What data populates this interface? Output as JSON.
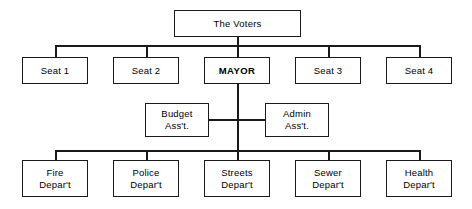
{
  "diagram": {
    "type": "organizational-chart",
    "background_color": "#ffffff",
    "line_color": "#1a1a1a",
    "text_color": "#000000",
    "levels": [
      {
        "level": 1,
        "name": "electorate",
        "nodes": [
          {
            "id": "voters",
            "label": "The Voters",
            "emphasis": false,
            "x": 174,
            "y": 10,
            "w": 127,
            "h": 27
          }
        ]
      },
      {
        "level": 2,
        "name": "elected-officials",
        "nodes": [
          {
            "id": "seat1",
            "label": "Seat 1",
            "emphasis": false,
            "x": 22,
            "y": 57,
            "w": 66,
            "h": 27
          },
          {
            "id": "seat2",
            "label": "Seat 2",
            "emphasis": false,
            "x": 113,
            "y": 57,
            "w": 66,
            "h": 27
          },
          {
            "id": "mayor",
            "label": "MAYOR",
            "emphasis": true,
            "x": 204,
            "y": 57,
            "w": 66,
            "h": 27
          },
          {
            "id": "seat3",
            "label": "Seat 3",
            "emphasis": false,
            "x": 295,
            "y": 57,
            "w": 66,
            "h": 27
          },
          {
            "id": "seat4",
            "label": "Seat 4",
            "emphasis": false,
            "x": 386,
            "y": 57,
            "w": 66,
            "h": 27
          }
        ]
      },
      {
        "level": 3,
        "name": "assistants",
        "nodes": [
          {
            "id": "budget",
            "label": "Budget\nAss't.",
            "emphasis": false,
            "x": 145,
            "y": 103,
            "w": 64,
            "h": 34
          },
          {
            "id": "admin",
            "label": "Admin\nAss't.",
            "emphasis": false,
            "x": 265,
            "y": 103,
            "w": 64,
            "h": 34
          }
        ]
      },
      {
        "level": 4,
        "name": "departments",
        "nodes": [
          {
            "id": "fire",
            "label": "Fire\nDepar't",
            "emphasis": false,
            "x": 22,
            "y": 160,
            "w": 66,
            "h": 37
          },
          {
            "id": "police",
            "label": "Police\nDepar't",
            "emphasis": false,
            "x": 113,
            "y": 160,
            "w": 66,
            "h": 37
          },
          {
            "id": "streets",
            "label": "Streets\nDepar't",
            "emphasis": false,
            "x": 204,
            "y": 160,
            "w": 66,
            "h": 37
          },
          {
            "id": "sewer",
            "label": "Sewer\nDepar't",
            "emphasis": false,
            "x": 295,
            "y": 160,
            "w": 66,
            "h": 37
          },
          {
            "id": "health",
            "label": "Health\nDepar't",
            "emphasis": false,
            "x": 386,
            "y": 160,
            "w": 66,
            "h": 37
          }
        ]
      }
    ],
    "connectors": [
      {
        "id": "voters-drop",
        "orient": "v",
        "x": 237,
        "y": 37,
        "len": 8
      },
      {
        "id": "council-bus",
        "orient": "h",
        "x": 55,
        "y": 45,
        "len": 365
      },
      {
        "id": "seat1-riser",
        "orient": "v",
        "x": 55,
        "y": 45,
        "len": 12
      },
      {
        "id": "seat2-riser",
        "orient": "v",
        "x": 146,
        "y": 45,
        "len": 12
      },
      {
        "id": "mayor-riser",
        "orient": "v",
        "x": 237,
        "y": 45,
        "len": 12
      },
      {
        "id": "seat3-riser",
        "orient": "v",
        "x": 328,
        "y": 45,
        "len": 12
      },
      {
        "id": "seat4-riser",
        "orient": "v",
        "x": 419,
        "y": 45,
        "len": 12
      },
      {
        "id": "mayor-spine",
        "orient": "v",
        "x": 237,
        "y": 84,
        "len": 76
      },
      {
        "id": "budget-link",
        "orient": "h",
        "x": 209,
        "y": 119,
        "len": 29
      },
      {
        "id": "admin-link",
        "orient": "h",
        "x": 237,
        "y": 119,
        "len": 29
      },
      {
        "id": "dept-bus",
        "orient": "h",
        "x": 55,
        "y": 150,
        "len": 365
      },
      {
        "id": "fire-riser",
        "orient": "v",
        "x": 55,
        "y": 150,
        "len": 11
      },
      {
        "id": "police-riser",
        "orient": "v",
        "x": 146,
        "y": 150,
        "len": 11
      },
      {
        "id": "streets-riser",
        "orient": "v",
        "x": 237,
        "y": 150,
        "len": 11
      },
      {
        "id": "sewer-riser",
        "orient": "v",
        "x": 328,
        "y": 150,
        "len": 11
      },
      {
        "id": "health-riser",
        "orient": "v",
        "x": 419,
        "y": 150,
        "len": 11
      }
    ]
  }
}
